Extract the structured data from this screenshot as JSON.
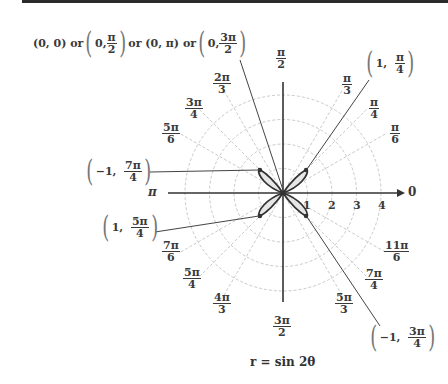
{
  "figure": {
    "equation": "r = sin 2θ",
    "pole_annotation": {
      "parts": [
        "(0, 0) or",
        "0,",
        "π",
        "2",
        "or (0, π) or",
        "0,",
        "3π",
        "2"
      ]
    },
    "angle_labels": [
      {
        "id": "pi_2",
        "num": "π",
        "den": "2"
      },
      {
        "id": "pi_3",
        "num": "π",
        "den": "3"
      },
      {
        "id": "pi_4",
        "num": "π",
        "den": "4"
      },
      {
        "id": "pi_6",
        "num": "π",
        "den": "6"
      },
      {
        "id": "2pi_3",
        "num": "2π",
        "den": "3"
      },
      {
        "id": "3pi_4",
        "num": "3π",
        "den": "4"
      },
      {
        "id": "5pi_6",
        "num": "5π",
        "den": "6"
      },
      {
        "id": "7pi_6",
        "num": "7π",
        "den": "6"
      },
      {
        "id": "5pi_4",
        "num": "5π",
        "den": "4"
      },
      {
        "id": "4pi_3",
        "num": "4π",
        "den": "3"
      },
      {
        "id": "3pi_2",
        "num": "3π",
        "den": "2"
      },
      {
        "id": "5pi_3",
        "num": "5π",
        "den": "3"
      },
      {
        "id": "7pi_4",
        "num": "7π",
        "den": "4"
      },
      {
        "id": "11pi_6",
        "num": "11π",
        "den": "6"
      }
    ],
    "axis_labels": {
      "zero": "0",
      "pi": "π"
    },
    "radial_ticks": [
      "1",
      "2",
      "3",
      "4"
    ],
    "points": [
      {
        "id": "p1",
        "r": "1,",
        "num": "π",
        "den": "4"
      },
      {
        "id": "p2",
        "r": "−1,",
        "num": "7π",
        "den": "4"
      },
      {
        "id": "p3",
        "r": "1,",
        "num": "5π",
        "den": "4"
      },
      {
        "id": "p4",
        "r": "−1,",
        "num": "3π",
        "den": "4"
      }
    ]
  }
}
